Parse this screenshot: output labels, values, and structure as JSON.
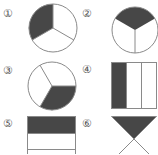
{
  "colors": {
    "fill": "#474747",
    "stroke": "#8a8a8a",
    "background": "#ffffff"
  },
  "figures": [
    {
      "label": "①",
      "shape": "circle",
      "divisions": 3,
      "shaded": 1
    },
    {
      "label": "②",
      "shape": "circle",
      "divisions": 3,
      "shaded": 1
    },
    {
      "label": "③",
      "shape": "circle",
      "divisions": 3,
      "shaded": 1
    },
    {
      "label": "④",
      "shape": "rectangle",
      "divisions": 3,
      "shaded": 1
    },
    {
      "label": "⑤",
      "shape": "rectangle",
      "divisions": 3,
      "shaded": 1
    },
    {
      "label": "⑥",
      "shape": "crossed-square",
      "divisions": 4,
      "shaded": 1
    }
  ]
}
